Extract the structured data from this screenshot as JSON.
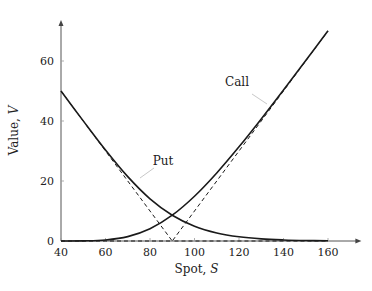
{
  "chart_data": {
    "type": "line",
    "title": "",
    "xlabel": "Spot, ",
    "xlabel_var": "S",
    "ylabel": "Value, ",
    "ylabel_var": "V",
    "xlim": [
      40,
      175
    ],
    "ylim": [
      0,
      75
    ],
    "xticks": [
      40,
      60,
      80,
      100,
      120,
      140,
      160
    ],
    "yticks": [
      0,
      20,
      40,
      60
    ],
    "grid": false,
    "strike": 90,
    "x": [
      40,
      50,
      60,
      70,
      80,
      90,
      100,
      110,
      120,
      130,
      140,
      150,
      160
    ],
    "series": [
      {
        "name": "Call",
        "style": "solid",
        "values": [
          0.0,
          0.04,
          0.33,
          1.45,
          4.07,
          8.6,
          14.93,
          22.69,
          31.4,
          40.7,
          50.35,
          60.16,
          70.08
        ]
      },
      {
        "name": "Put",
        "style": "solid",
        "values": [
          50.0,
          40.04,
          30.33,
          21.45,
          14.07,
          8.6,
          4.93,
          2.69,
          1.4,
          0.7,
          0.35,
          0.16,
          0.08
        ]
      },
      {
        "name": "Call payoff",
        "style": "dashed",
        "values": [
          0,
          0,
          0,
          0,
          0,
          0,
          10,
          20,
          30,
          40,
          50,
          60,
          70
        ]
      },
      {
        "name": "Put payoff",
        "style": "dashed",
        "values": [
          50,
          40,
          30,
          20,
          10,
          0,
          0,
          0,
          0,
          0,
          0,
          0,
          0
        ]
      }
    ],
    "annotations": [
      {
        "text": "Call",
        "series": "Call",
        "at_x": 137
      },
      {
        "text": "Put",
        "series": "Put",
        "at_x": 75
      }
    ],
    "colors": {
      "curve": "#1a1a1a",
      "axis": "#555555",
      "pointer": "#c8c8c8"
    }
  }
}
